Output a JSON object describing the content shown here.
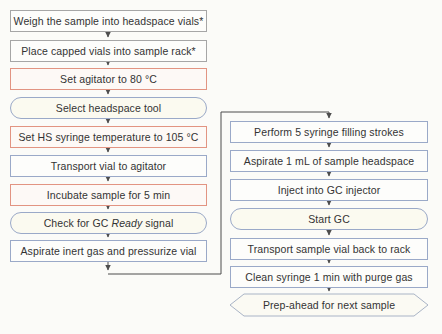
{
  "flowchart": {
    "title": "Headspace GC sample preparation flowchart",
    "left_steps": [
      {
        "label": "Weigh the sample into headspace vials*",
        "shape": "rect",
        "border": "gray"
      },
      {
        "label": "Place capped vials into sample rack*",
        "shape": "rect",
        "border": "gray"
      },
      {
        "label": "Set agitator to 80 °C",
        "shape": "rect",
        "border": "red"
      },
      {
        "label": "Select headspace tool",
        "shape": "stadium",
        "border": "blue"
      },
      {
        "label": "Set HS syringe temperature to 105 °C",
        "shape": "rect",
        "border": "red"
      },
      {
        "label": "Transport vial to agitator",
        "shape": "rect",
        "border": "blue"
      },
      {
        "label": "Incubate sample for 5 min",
        "shape": "rect",
        "border": "red"
      },
      {
        "label_prefix": "Check for GC ",
        "label_italic": "Ready",
        "label_suffix": " signal",
        "shape": "stadium",
        "border": "blue"
      },
      {
        "label": "Aspirate inert gas and pressurize vial",
        "shape": "rect",
        "border": "blue"
      }
    ],
    "right_steps": [
      {
        "label": "Perform 5 syringe filling strokes",
        "shape": "rect",
        "border": "blue"
      },
      {
        "label": "Aspirate 1 mL of sample headspace",
        "shape": "rect",
        "border": "blue"
      },
      {
        "label": "Inject into GC injector",
        "shape": "rect",
        "border": "blue"
      },
      {
        "label": "Start GC",
        "shape": "stadium",
        "border": "blue"
      },
      {
        "label": "Transport sample vial back to rack",
        "shape": "rect",
        "border": "blue"
      },
      {
        "label": "Clean syringe 1 min with purge gas",
        "shape": "rect",
        "border": "blue"
      },
      {
        "label": "Prep-ahead for next sample",
        "shape": "hexagon",
        "border": "blue"
      }
    ],
    "colors": {
      "manual_step_border": "#a6a6a6",
      "set_step_border": "#e29482",
      "action_step_border": "#9aa9c8",
      "arrow": "#4d4d4d"
    }
  }
}
